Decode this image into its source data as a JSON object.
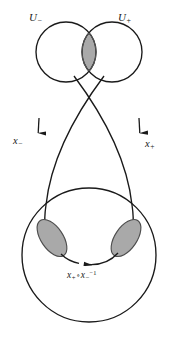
{
  "figure": {
    "caption_type": "manifold-chart-transition-diagram",
    "background_color": "#ffffff",
    "stroke_color": "#1a1a1a",
    "overlap_fill_color": "#a9a9a9",
    "overlap_stroke_color": "#4d4d4d"
  },
  "labels": {
    "chart_minus": {
      "base": "U",
      "subscript": "−",
      "full": "U₋"
    },
    "chart_plus": {
      "base": "U",
      "subscript": "+",
      "full": "U₊"
    },
    "map_minus": {
      "base": "x",
      "subscript": "−",
      "full": "x₋"
    },
    "map_plus": {
      "base": "x",
      "subscript": "+",
      "full": "x₊"
    },
    "transition": {
      "left_base": "x",
      "left_subscript": "+",
      "operator": "∘",
      "right_base": "x",
      "right_subscript": "−",
      "right_superscript": "−1",
      "full": "x₊ ∘ x₋⁻¹"
    }
  },
  "shapes": {
    "top_circle_left": {
      "cx": 66,
      "cy": 52,
      "r": 30
    },
    "top_circle_right": {
      "cx": 112,
      "cy": 52,
      "r": 30
    },
    "bottom_circle": {
      "cx": 89,
      "cy": 255,
      "r": 67
    },
    "lens_left": {
      "cx": 52,
      "cy": 238
    },
    "lens_right": {
      "cx": 126,
      "cy": 238
    }
  },
  "arrows": {
    "left_down": {
      "label": "x₋",
      "direction": "down"
    },
    "right_down": {
      "label": "x₊",
      "direction": "down"
    },
    "bottom_transition": {
      "label": "x₊ ∘ x₋⁻¹",
      "direction": "left"
    }
  }
}
